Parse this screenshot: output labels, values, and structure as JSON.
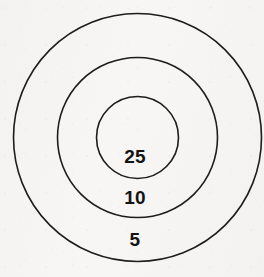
{
  "figure": {
    "name": "concentric-target-diagram",
    "background_color": "#f7f6f4",
    "stroke_color": "#1d1d1d",
    "label_color": "#141414",
    "width": 264,
    "height": 277
  },
  "chart_data": {
    "type": "pie",
    "title": "",
    "subtitle": "",
    "xlabel": "",
    "ylabel": "",
    "grid": false,
    "legend_position": "none",
    "center": {
      "x": 137.5,
      "y": 137.5
    },
    "categories": [
      "25",
      "10",
      "5"
    ],
    "values": [
      25,
      10,
      5
    ],
    "rings": [
      {
        "label": "5",
        "value": 5,
        "band": "outer",
        "radius": 124,
        "label_x": 135,
        "label_y": 240
      },
      {
        "label": "10",
        "value": 10,
        "band": "middle",
        "radius": 80,
        "label_x": 135,
        "label_y": 198
      },
      {
        "label": "25",
        "value": 25,
        "band": "inner",
        "radius": 41,
        "label_x": 135,
        "label_y": 157
      }
    ]
  }
}
